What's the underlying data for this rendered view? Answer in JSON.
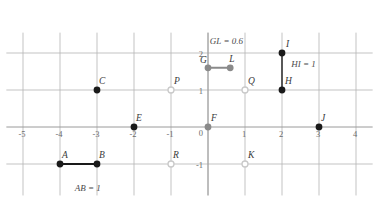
{
  "figure": {
    "title": "",
    "background_color": "#ffffff"
  },
  "chart_data": {
    "type": "scatter",
    "title": "",
    "xlabel": "",
    "ylabel": "",
    "xlim": [
      -5.4,
      4.4
    ],
    "ylim": [
      -1.75,
      2.6
    ],
    "grid": true,
    "legend": "none",
    "x_ticks": [
      -5,
      -4,
      -3,
      -2,
      -1,
      0,
      1,
      2,
      3,
      4
    ],
    "x_tick_labels": [
      "-5",
      "-4",
      "-3",
      "-2",
      "-1",
      "0",
      "1",
      "2",
      "3",
      "4"
    ],
    "y_ticks": [
      -1,
      0,
      1,
      2
    ],
    "y_tick_labels": [
      "-1",
      "0",
      "1",
      "2"
    ],
    "points": [
      {
        "name": "A",
        "x": -4,
        "y": -1,
        "style": "filled-dark",
        "color": "#1a1a1a",
        "label": "A",
        "label_dx": 2,
        "label_dy": -6
      },
      {
        "name": "B",
        "x": -3,
        "y": -1,
        "style": "filled-dark",
        "color": "#1a1a1a",
        "label": "B",
        "label_dx": 2,
        "label_dy": -6
      },
      {
        "name": "C",
        "x": -3,
        "y": 1,
        "style": "filled-dark",
        "color": "#1a1a1a",
        "label": "C",
        "label_dx": 2,
        "label_dy": -6
      },
      {
        "name": "E",
        "x": -2,
        "y": 0,
        "style": "filled-dark",
        "color": "#1a1a1a",
        "label": "E",
        "label_dx": 2,
        "label_dy": -6
      },
      {
        "name": "P",
        "x": -1,
        "y": 1,
        "style": "open-light",
        "color": "#c9c9c9",
        "label": "P",
        "label_dx": 3,
        "label_dy": -6
      },
      {
        "name": "F",
        "x": 0,
        "y": 0,
        "style": "filled-gray",
        "color": "#8a8a8a",
        "label": "F",
        "label_dx": 3,
        "label_dy": -6
      },
      {
        "name": "G",
        "x": 0,
        "y": 1.6,
        "style": "filled-gray",
        "color": "#8a8a8a",
        "label": "G",
        "label_dx": -8,
        "label_dy": -5
      },
      {
        "name": "L",
        "x": 0.6,
        "y": 1.6,
        "style": "filled-gray",
        "color": "#8a8a8a",
        "label": "L",
        "label_dx": -1,
        "label_dy": -6
      },
      {
        "name": "Q",
        "x": 1,
        "y": 1,
        "style": "open-light",
        "color": "#c9c9c9",
        "label": "Q",
        "label_dx": 3,
        "label_dy": -6
      },
      {
        "name": "K",
        "x": 1,
        "y": -1,
        "style": "open-light",
        "color": "#c9c9c9",
        "label": "K",
        "label_dx": 3,
        "label_dy": -6
      },
      {
        "name": "R",
        "x": -1,
        "y": -1,
        "style": "open-light",
        "color": "#c9c9c9",
        "label": "R",
        "label_dx": 2,
        "label_dy": -6
      },
      {
        "name": "H",
        "x": 2,
        "y": 1,
        "style": "filled-dark",
        "color": "#1a1a1a",
        "label": "H",
        "label_dx": 3,
        "label_dy": -6
      },
      {
        "name": "I",
        "x": 2,
        "y": 2,
        "style": "filled-dark",
        "color": "#1a1a1a",
        "label": "I",
        "label_dx": 4,
        "label_dy": -6
      },
      {
        "name": "J",
        "x": 3,
        "y": 0,
        "style": "filled-dark",
        "color": "#1a1a1a",
        "label": "J",
        "label_dx": 2,
        "label_dy": -6
      }
    ],
    "segments": [
      {
        "name": "AB",
        "from": "A",
        "to": "B",
        "color": "#1a1a1a",
        "width": 2.0
      },
      {
        "name": "GL",
        "from": "G",
        "to": "L",
        "color": "#8a8a8a",
        "width": 2.0
      },
      {
        "name": "HI",
        "from": "H",
        "to": "I",
        "color": "#4a4a4a",
        "width": 1.8
      }
    ],
    "annotations": [
      {
        "name": "ab-measure",
        "text": "AB = 1",
        "x": -3.6,
        "y": -1.72
      },
      {
        "name": "gl-measure",
        "text": "GL = 0.6",
        "x": 0.05,
        "y": 2.25
      },
      {
        "name": "hi-measure",
        "text": "HI = 1",
        "x": 2.25,
        "y": 1.62
      }
    ]
  },
  "axes": {
    "x_axis_color": "#9a9a9a",
    "y_axis_color": "#9a9a9a",
    "grid_color": "#b4b4b4",
    "tick_label_color": "#6b6b6b"
  }
}
